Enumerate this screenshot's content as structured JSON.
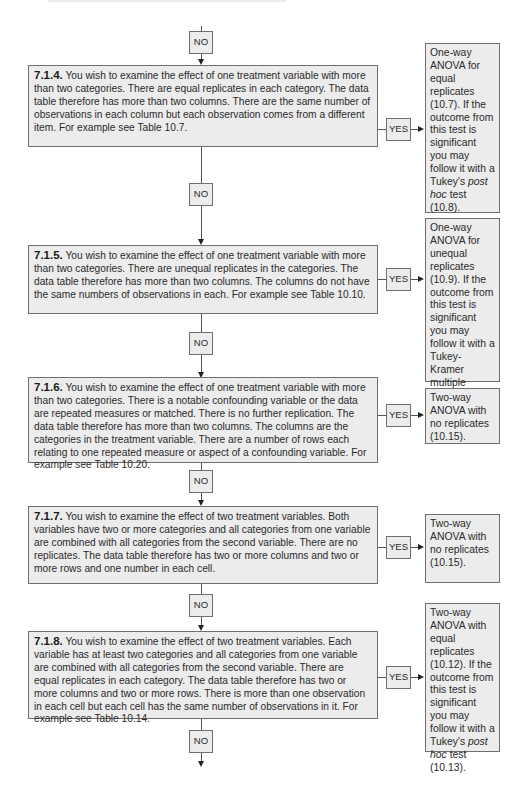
{
  "flowchart": {
    "labels": {
      "no": "NO",
      "yes": "YES"
    },
    "steps": [
      {
        "id": "7.1.4",
        "number": "7.1.4.",
        "text": " You wish to examine the effect of one treatment variable with more than two categories. There are equal replicates in each category. The data table therefore has more than two columns. There are the same number of observations in each column but each observation comes from a different item. For example see Table 10.7.",
        "result": {
          "before": "One-way ANOVA for equal replicates (10.7). If the outcome from this test is significant you may follow it with a Tukey's ",
          "italic": "post hoc",
          "after": " test (10.8)."
        }
      },
      {
        "id": "7.1.5",
        "number": "7.1.5.",
        "text": " You wish to examine the effect of one treatment variable with more than two categories. There are unequal replicates in the categories. The data table therefore has more than two columns. The columns do not have the same numbers of observations in each. For example see Table 10.10.",
        "result": {
          "before": "One-way ANOVA for unequal replicates (10.9). If the outcome from this test is significant you may follow it with a Tukey-Kramer multiple comparisons test (10.10).",
          "italic": "",
          "after": ""
        }
      },
      {
        "id": "7.1.6",
        "number": "7.1.6.",
        "text": " You wish to examine the effect of one treatment variable with more than two categories. There is a notable confounding variable or the data are repeated measures or matched. There is no further replication. The data table therefore has more than two columns. The columns are the categories in the treatment variable. There are a number of rows each relating to one repeated measure or aspect of a confounding variable. For example see Table 10.20.",
        "result": {
          "before": "Two-way ANOVA with no replicates (10.15).",
          "italic": "",
          "after": ""
        }
      },
      {
        "id": "7.1.7",
        "number": "7.1.7.",
        "text": " You wish to examine the effect of two treatment variables. Both variables have two or more categories and all categories from one variable are combined with all categories from the second variable. There are no replicates. The data table therefore has two or more columns and two or more rows and one number in each cell.",
        "result": {
          "before": "Two-way ANOVA with no replicates (10.15).",
          "italic": "",
          "after": ""
        }
      },
      {
        "id": "7.1.8",
        "number": "7.1.8.",
        "text": " You wish to examine the effect of two treatment variables. Each variable has at least two categories and all categories from one variable are combined with all categories from the second variable. There are equal replicates in each category. The data table therefore has two or more columns and two or more rows. There is more than one observation in each cell but each cell has the same number of observations in it. For example see Table 10.14.",
        "result": {
          "before": "Two-way ANOVA with equal replicates (10.12). If the outcome from this test is significant you may follow it with a Tukey's ",
          "italic": "post hoc",
          "after": " test (10.13)."
        }
      }
    ]
  }
}
